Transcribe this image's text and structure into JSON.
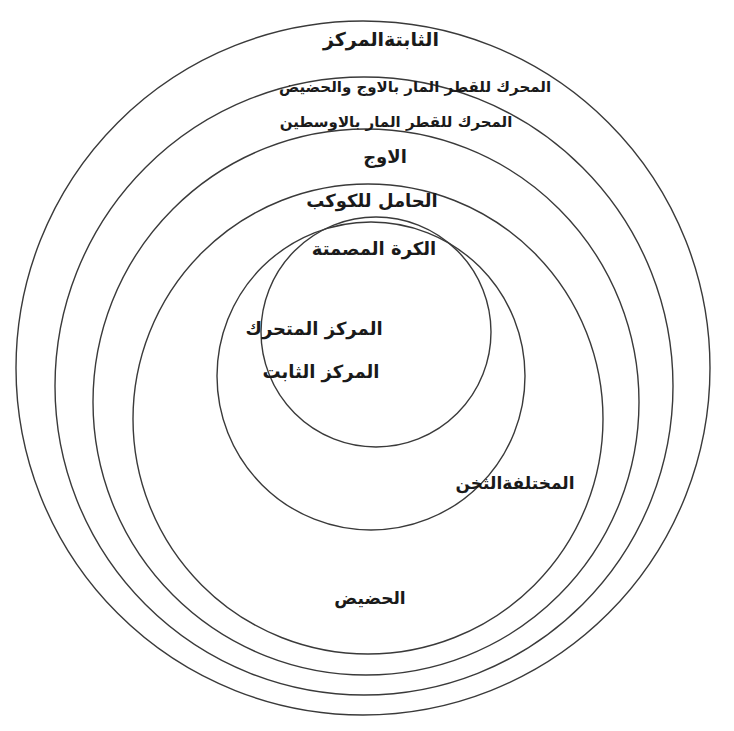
{
  "diagram": {
    "type": "eccentric-spheres",
    "circles": [
      {
        "id": "outer-fixed-center",
        "cx": 363,
        "cy": 368,
        "r": 347
      },
      {
        "id": "mover-apogee-perigee-pole",
        "cx": 364,
        "cy": 386,
        "r": 309
      },
      {
        "id": "mover-mean-pole",
        "cx": 366,
        "cy": 402,
        "r": 273
      },
      {
        "id": "apogee-sphere",
        "cx": 368,
        "cy": 419,
        "r": 235
      },
      {
        "id": "deferent",
        "cx": 371,
        "cy": 376,
        "r": 154
      },
      {
        "id": "solid-sphere",
        "cx": 376,
        "cy": 332,
        "r": 115
      }
    ],
    "labels": {
      "fixed_center_sphere": "الثابتةالمركز",
      "mover_apogee_perigee": "المحرك للقطر المار بالاوج والحضيض",
      "mover_mean_distances": "المحرك للقطر المار بالاوسطين",
      "apogee": "الاوج",
      "deferent": "الحامل للكوكب",
      "solid_sphere": "الكرة المصمتة",
      "moving_center": "المركز المتحرك",
      "fixed_center": "المركز الثابت",
      "varying_thickness": "المختلفةالثخن",
      "perigee": "الحضيض"
    }
  }
}
